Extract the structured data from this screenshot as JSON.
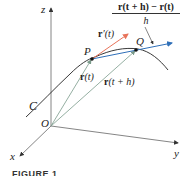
{
  "figure": {
    "caption": "FIGURE 1",
    "axes": {
      "x_label": "x",
      "y_label": "y",
      "z_label": "z",
      "origin_label": "O"
    },
    "curve_label": "C",
    "points": {
      "P": "P",
      "Q": "Q"
    },
    "vectors": {
      "r_t_bold": "r",
      "r_t_arg": "(t)",
      "r_th_bold": "r",
      "r_th_arg": "(t + h)",
      "r_prime_bold": "r",
      "r_prime_arg": "′(t)"
    },
    "fraction": {
      "numerator": "r(t + h) − r(t)",
      "denominator": "h"
    },
    "colors": {
      "axis": "#555555",
      "curve": "#222222",
      "tangent": "#e8735a",
      "secant": "#2f6fb8",
      "position_vectors": "#7a9a8a"
    }
  }
}
